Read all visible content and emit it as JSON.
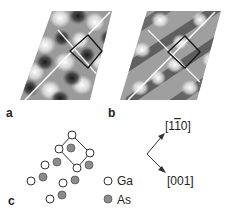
{
  "figure": {
    "panels": [
      {
        "id": "a",
        "label": "a",
        "description": "simulated STM image with square unit cell, dark spot pattern"
      },
      {
        "id": "b",
        "label": "b",
        "description": "simulated STM image with square unit cell, stripe pattern"
      },
      {
        "id": "c",
        "label": "c",
        "description": "atomic model of surface"
      }
    ],
    "legend": [
      {
        "symbol": "open-circle",
        "label": "Ga",
        "color": "#ffffff"
      },
      {
        "symbol": "gray-circle",
        "label": "As",
        "color": "#8a8a8a"
      }
    ],
    "directions": {
      "up": "[1̄ 10]",
      "up_parts": {
        "open": "[1",
        "bar": "1",
        "close": "0]"
      },
      "down": "[001]"
    },
    "colors": {
      "ga_fill": "#ffffff",
      "as_fill": "#8c8c8c",
      "stroke": "#333333"
    }
  }
}
